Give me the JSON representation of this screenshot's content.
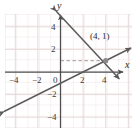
{
  "figure": {
    "kind": "coordinate-plane-two-lines",
    "width": 137,
    "height": 133,
    "background": "#ffffff",
    "grid": {
      "visible": true,
      "color": "#e9dede",
      "minor_color": "#f2e8e8",
      "cell_px": 11.3,
      "left": 5,
      "top": 14,
      "right": 132,
      "bottom": 128
    },
    "axes": {
      "color": "#4d4d4d",
      "origin_px": {
        "x": 60.5,
        "y": 72
      },
      "unit_px": 11.3,
      "x_axis": {
        "label": "x",
        "label_pos": {
          "x": 126,
          "y": 66
        },
        "arrow": "right"
      },
      "y_axis": {
        "label": "y",
        "label_pos": {
          "x": 59,
          "y": 2
        },
        "arrow": "up"
      },
      "x_ticks": [
        {
          "value": -4,
          "label": "−4",
          "px": 15.3
        },
        {
          "value": -2,
          "label": "−2",
          "px": 37.9
        },
        {
          "value": 0,
          "label": "0",
          "px": 60.5
        },
        {
          "value": 2,
          "label": "2",
          "px": 83.1
        },
        {
          "value": 4,
          "label": "4",
          "px": 105.7
        }
      ],
      "y_ticks": [
        {
          "value": 4,
          "label": "4",
          "px": 26.8
        },
        {
          "value": 2,
          "label": "2",
          "px": 49.4
        },
        {
          "value": -2,
          "label": "−2",
          "px": 94.6
        },
        {
          "value": -4,
          "label": "−4",
          "px": 117.2
        }
      ]
    },
    "lines": [
      {
        "name": "descending-line",
        "color": "#5a5a5a",
        "slope": -1,
        "intercept": 5,
        "arrows": "both",
        "from": {
          "x": -0.4,
          "y": 5.4
        },
        "to": {
          "x": 5.6,
          "y": -0.6
        }
      },
      {
        "name": "ascending-line",
        "color": "#5a5a5a",
        "slope": 0.5,
        "intercept": -1,
        "arrows": "both",
        "from": {
          "x": -5.0,
          "y": -3.5
        },
        "to": {
          "x": 6.2,
          "y": 2.1
        }
      }
    ],
    "intersection": {
      "label": "(4, 1)",
      "x": 4,
      "y": 1,
      "px": {
        "x": 105.7,
        "y": 60.7
      },
      "marker_color": "#8a8a8a",
      "label_px": {
        "x": 92,
        "y": 36
      }
    },
    "guide": {
      "name": "dashed-guide-y1",
      "style": "dashed",
      "color": "#b0a8a8",
      "from_px": {
        "x": 60.5,
        "y": 60.7
      },
      "to_px": {
        "x": 105.7,
        "y": 60.7
      }
    }
  }
}
